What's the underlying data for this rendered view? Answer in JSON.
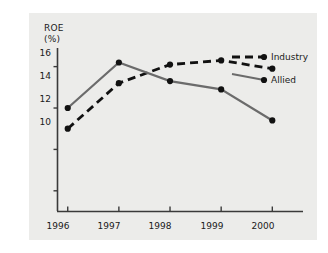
{
  "chart_data": {
    "type": "line",
    "title": "",
    "xlabel": "",
    "ylabel": "ROE (%)",
    "ylabel_line1": "ROE",
    "ylabel_line2": "(%)",
    "categories": [
      "1996",
      "1997",
      "1998",
      "1999",
      "2000"
    ],
    "x": [
      1996,
      1997,
      1998,
      1999,
      2000
    ],
    "ylim": [
      9.0,
      16.9
    ],
    "xlim": [
      1995.8,
      2000.6
    ],
    "yticks": [
      10,
      12,
      14,
      16
    ],
    "ytick_labels": [
      "10",
      "12",
      "14",
      "16"
    ],
    "xtick_labels": [
      "1996",
      "1997",
      "1998",
      "1999",
      "2000"
    ],
    "grid": false,
    "legend_position": "right-inline",
    "series": [
      {
        "name": "Industry",
        "values": [
          13.0,
          15.2,
          16.1,
          16.3,
          15.9
        ],
        "style": "dashed",
        "color": "#111111",
        "marker": "circle"
      },
      {
        "name": "Allied",
        "values": [
          14.0,
          16.2,
          15.3,
          14.9,
          13.4
        ],
        "style": "solid",
        "color": "#6b6b6b",
        "marker": "circle"
      }
    ]
  },
  "axis": {
    "y_label_top": "ROE",
    "y_label_bottom": "(%)",
    "ytick_10": "10",
    "ytick_12": "12",
    "ytick_14": "14",
    "ytick_16": "16",
    "xtick_1996": "1996",
    "xtick_1997": "1997",
    "xtick_1998": "1998",
    "xtick_1999": "1999",
    "xtick_2000": "2000"
  },
  "legend": {
    "industry": "Industry",
    "allied": "Allied"
  },
  "colors": {
    "panel_background": "#ececea",
    "page_background": "#ffffff",
    "axis": "#3a3a3a",
    "industry_line": "#111111",
    "allied_line": "#6b6b6b",
    "text": "#1a1a1a"
  }
}
